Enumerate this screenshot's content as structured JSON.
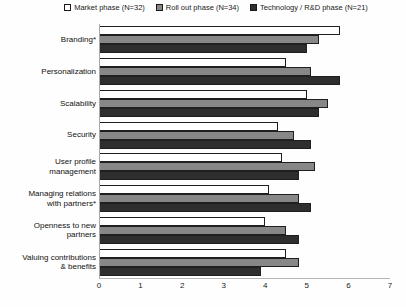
{
  "chart_data": {
    "type": "bar",
    "orientation": "horizontal",
    "title": "",
    "xlabel": "",
    "ylabel": "",
    "categories": [
      "Branding*",
      "Personalization",
      "Scalability",
      "Security",
      "User profile\nmanagement",
      "Managing relations\nwith partners*",
      "Openness to new\npartners",
      "Valuing contributions\n& benefits"
    ],
    "series": [
      {
        "name": "Market phase (N=32)",
        "color": "#ffffff",
        "values": [
          5.8,
          4.5,
          5.0,
          4.3,
          4.4,
          4.1,
          4.0,
          4.5
        ]
      },
      {
        "name": "Roll out phase (N=34)",
        "color": "#878787",
        "values": [
          5.3,
          5.1,
          5.5,
          4.7,
          5.2,
          4.8,
          4.5,
          4.8
        ]
      },
      {
        "name": "Technology / R&D phase (N=21)",
        "color": "#2e2e2e",
        "values": [
          5.0,
          5.8,
          5.3,
          5.1,
          4.8,
          5.1,
          4.8,
          3.9
        ]
      }
    ],
    "xlim": [
      0,
      7
    ],
    "x_ticks": [
      0,
      1,
      2,
      3,
      4,
      5,
      6,
      7
    ],
    "legend_position": "top",
    "grid": false,
    "colors": {
      "bar_border": "#1f1f1f",
      "axis_line": "#b0b0b0",
      "text": "#1a1a1a"
    }
  }
}
